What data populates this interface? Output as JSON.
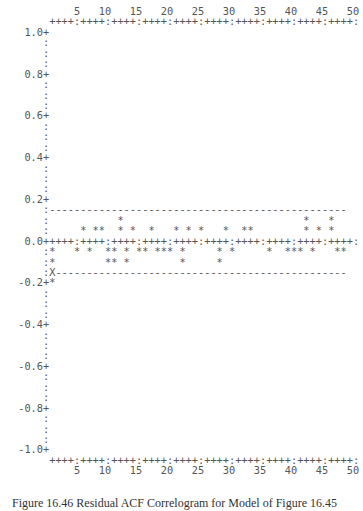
{
  "chart_data": {
    "type": "bar",
    "style": "ascii-acf-plot",
    "title": "",
    "caption": "Figure 16.46  Residual ACF Correlogram for Model of Figure 16.45",
    "xlabel": "Lag",
    "ylabel": "Autocorrelation",
    "x_ticks": [
      5,
      10,
      15,
      20,
      25,
      30,
      35,
      40,
      45,
      50
    ],
    "y_ticks": [
      "1.00",
      "0.80",
      "0.60",
      "0.40",
      "0.20",
      "0.00",
      "-0.20",
      "-0.40",
      "-0.60",
      "-0.80",
      "-1.00"
    ],
    "ylim": [
      -1.0,
      1.0
    ],
    "xlim": [
      1,
      50
    ],
    "confidence_limits": [
      0.15,
      -0.15
    ],
    "rows_per_0_05": 1,
    "star_rows": {
      "0.10": [
        12,
        42,
        46
      ],
      "0.05": [
        6,
        8,
        9,
        12,
        14,
        17,
        21,
        23,
        25,
        29,
        32,
        33,
        42,
        44,
        46
      ],
      "-0.05": [
        1,
        5,
        7,
        10,
        11,
        13,
        15,
        16,
        18,
        19,
        20,
        22,
        28,
        30,
        36,
        39,
        40,
        41,
        43,
        47,
        48
      ],
      "-0.10": [
        1,
        10,
        11,
        13,
        22,
        28
      ],
      "-0.15": [
        1
      ],
      "-0.20": [
        1
      ]
    },
    "categories": [
      1,
      2,
      3,
      4,
      5,
      6,
      7,
      8,
      9,
      10,
      11,
      12,
      13,
      14,
      15,
      16,
      17,
      18,
      19,
      20,
      21,
      22,
      23,
      24,
      25,
      26,
      27,
      28,
      29,
      30,
      31,
      32,
      33,
      34,
      35,
      36,
      37,
      38,
      39,
      40,
      41,
      42,
      43,
      44,
      45,
      46,
      47,
      48,
      49,
      50
    ],
    "values": [
      -0.2,
      0,
      0,
      0,
      -0.05,
      0.05,
      -0.05,
      0.05,
      0.05,
      -0.1,
      -0.1,
      0.1,
      -0.1,
      0.05,
      -0.05,
      -0.05,
      0.05,
      -0.05,
      -0.05,
      -0.05,
      0.05,
      -0.1,
      0.05,
      0,
      0.05,
      0,
      0,
      -0.1,
      0.05,
      -0.05,
      0,
      0.05,
      0.05,
      0,
      0,
      -0.05,
      0,
      0,
      -0.05,
      -0.05,
      -0.05,
      0.1,
      -0.05,
      0.05,
      0,
      0.1,
      -0.05,
      -0.05,
      0,
      0
    ],
    "grid": false,
    "legend": null
  },
  "figure": {
    "caption": "Figure 16.46  Residual ACF Correlogram for Model of Figure 16.45"
  }
}
